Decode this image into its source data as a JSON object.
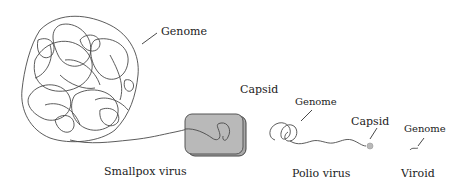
{
  "diagram": {
    "type": "virus size comparison",
    "colors": {
      "strand": "#4a4a4a",
      "capsid_fill": "#b9b9b9",
      "capsid_stroke": "#555555",
      "text": "#222222"
    },
    "items": [
      {
        "name": "Smallpox virus",
        "labels": {
          "genome": "Genome",
          "capsid": "Capsid",
          "caption": "Smallpox virus"
        }
      },
      {
        "name": "Polio virus",
        "labels": {
          "genome": "Genome",
          "capsid": "Capsid",
          "caption": "Polio virus"
        }
      },
      {
        "name": "Viroid",
        "labels": {
          "genome": "Genome",
          "caption": "Viroid"
        }
      }
    ]
  }
}
